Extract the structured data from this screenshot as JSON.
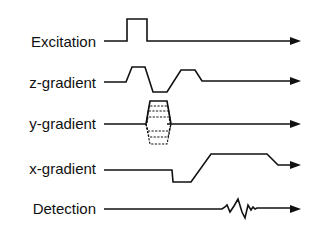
{
  "rows": [
    {
      "id": "excitation",
      "label": "Excitation",
      "waveform": "rf-pulse"
    },
    {
      "id": "z-gradient",
      "label": "z-gradient",
      "waveform": "slice-select-with-rephase"
    },
    {
      "id": "y-gradient",
      "label": "y-gradient",
      "waveform": "phase-encode-table"
    },
    {
      "id": "x-gradient",
      "label": "x-gradient",
      "waveform": "readout-with-dephase"
    },
    {
      "id": "detection",
      "label": "Detection",
      "waveform": "echo-signal"
    }
  ],
  "colors": {
    "line": "#111111",
    "background": "#ffffff"
  }
}
